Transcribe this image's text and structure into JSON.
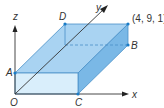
{
  "diagram": {
    "title": "",
    "axes": {
      "x": "x",
      "y": "y",
      "z": "z"
    },
    "points": {
      "origin": "O",
      "a": "A",
      "b": "B",
      "c": "C",
      "d": "D",
      "corner_coord": "(4, 9, 1)"
    },
    "colors": {
      "top_face": "#a9d3f2",
      "front_face": "#d9eefb",
      "side_face": "#7ab8e6",
      "edge": "#4a90c8",
      "axis": "#333333",
      "point": "#1a7cc7"
    }
  }
}
